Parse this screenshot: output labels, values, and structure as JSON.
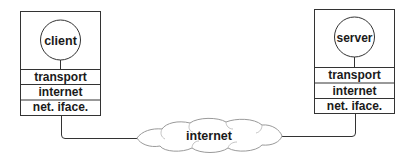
{
  "diagram": {
    "client_host": {
      "app": "client",
      "layers": [
        "transport",
        "internet",
        "net. iface."
      ]
    },
    "server_host": {
      "app": "server",
      "layers": [
        "transport",
        "internet",
        "net. iface."
      ]
    },
    "network": {
      "label": "internet"
    },
    "colors": {
      "stroke": "#333333",
      "cloud": "#9a9a9a",
      "text": "#1a1a1a",
      "background": "#ffffff"
    }
  }
}
